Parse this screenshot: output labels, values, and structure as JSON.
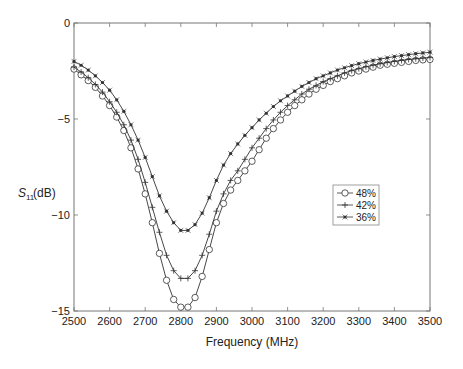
{
  "chart_data": {
    "type": "line",
    "title": "",
    "xlabel": "Frequency (MHz)",
    "ylabel": "S11(dB)",
    "ylabel_main": "S",
    "ylabel_sub": "11",
    "ylabel_unit": "(dB)",
    "xlim": [
      2500,
      3500
    ],
    "ylim": [
      -15,
      0
    ],
    "xticks": [
      2500,
      2600,
      2700,
      2800,
      2900,
      3000,
      3100,
      3200,
      3300,
      3400,
      3500
    ],
    "yticks": [
      0,
      -5,
      -10,
      -15
    ],
    "ytick_labels": [
      "0",
      "−5",
      "−10",
      "−15"
    ],
    "grid": false,
    "legend_position": "right-center",
    "x": [
      2500,
      2520,
      2540,
      2560,
      2580,
      2600,
      2620,
      2640,
      2660,
      2680,
      2700,
      2720,
      2740,
      2760,
      2780,
      2800,
      2820,
      2840,
      2860,
      2880,
      2900,
      2920,
      2940,
      2960,
      2980,
      3000,
      3020,
      3040,
      3060,
      3080,
      3100,
      3120,
      3140,
      3160,
      3180,
      3200,
      3220,
      3240,
      3260,
      3280,
      3300,
      3320,
      3340,
      3360,
      3380,
      3400,
      3420,
      3440,
      3460,
      3480,
      3500
    ],
    "series": [
      {
        "name": "48%",
        "marker": "circle",
        "values": [
          -2.4,
          -2.7,
          -3.0,
          -3.35,
          -3.8,
          -4.3,
          -4.9,
          -5.6,
          -6.5,
          -7.6,
          -8.9,
          -10.4,
          -12.0,
          -13.4,
          -14.4,
          -14.8,
          -14.8,
          -14.3,
          -13.2,
          -11.8,
          -10.4,
          -9.4,
          -8.7,
          -8.2,
          -7.7,
          -7.2,
          -6.6,
          -6.0,
          -5.5,
          -5.05,
          -4.65,
          -4.3,
          -4.0,
          -3.7,
          -3.45,
          -3.25,
          -3.05,
          -2.9,
          -2.75,
          -2.6,
          -2.5,
          -2.4,
          -2.3,
          -2.2,
          -2.15,
          -2.1,
          -2.05,
          -2.0,
          -1.95,
          -1.92,
          -1.9
        ]
      },
      {
        "name": "42%",
        "marker": "plus",
        "values": [
          -2.3,
          -2.55,
          -2.85,
          -3.2,
          -3.6,
          -4.1,
          -4.65,
          -5.3,
          -6.1,
          -7.1,
          -8.3,
          -9.6,
          -10.9,
          -12.1,
          -12.9,
          -13.3,
          -13.3,
          -12.9,
          -12.1,
          -11.0,
          -9.8,
          -8.9,
          -8.2,
          -7.7,
          -7.1,
          -6.5,
          -6.0,
          -5.5,
          -5.05,
          -4.65,
          -4.3,
          -4.0,
          -3.7,
          -3.45,
          -3.25,
          -3.05,
          -2.9,
          -2.75,
          -2.6,
          -2.48,
          -2.38,
          -2.28,
          -2.2,
          -2.12,
          -2.06,
          -2.0,
          -1.95,
          -1.9,
          -1.86,
          -1.83,
          -1.8
        ]
      },
      {
        "name": "36%",
        "marker": "star",
        "values": [
          -2.0,
          -2.2,
          -2.45,
          -2.75,
          -3.1,
          -3.5,
          -4.0,
          -4.6,
          -5.3,
          -6.1,
          -7.0,
          -8.0,
          -9.0,
          -9.8,
          -10.4,
          -10.8,
          -10.8,
          -10.5,
          -9.9,
          -9.1,
          -8.2,
          -7.4,
          -6.8,
          -6.3,
          -5.85,
          -5.45,
          -5.05,
          -4.7,
          -4.35,
          -4.05,
          -3.8,
          -3.55,
          -3.3,
          -3.1,
          -2.9,
          -2.75,
          -2.6,
          -2.45,
          -2.33,
          -2.22,
          -2.12,
          -2.03,
          -1.95,
          -1.88,
          -1.81,
          -1.75,
          -1.7,
          -1.65,
          -1.6,
          -1.56,
          -1.52
        ]
      }
    ]
  },
  "legend": {
    "items": [
      {
        "label": "48%",
        "marker": "circle"
      },
      {
        "label": "42%",
        "marker": "plus"
      },
      {
        "label": "36%",
        "marker": "star"
      }
    ]
  },
  "colors": {
    "line": "#333333",
    "axis": "#666666",
    "background": "#ffffff"
  }
}
